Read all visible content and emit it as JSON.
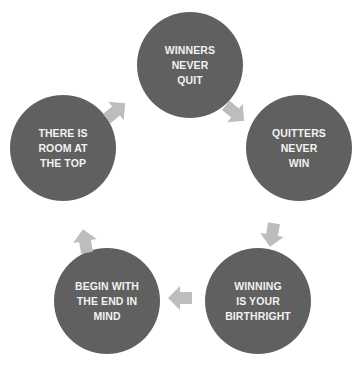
{
  "diagram": {
    "type": "cycle",
    "colors": {
      "node_fill": "#606060",
      "node_text": "#f2f2f2",
      "arrow_fill": "#bdbdbd",
      "background": "#ffffff"
    },
    "nodes": [
      {
        "id": "n1",
        "label": "WINNERS\nNEVER\nQUIT"
      },
      {
        "id": "n2",
        "label": "QUITTERS\nNEVER\nWIN"
      },
      {
        "id": "n3",
        "label": "WINNING\nIS YOUR\nBIRTHRIGHT"
      },
      {
        "id": "n4",
        "label": "BEGIN WITH\nTHE END IN\nMIND"
      },
      {
        "id": "n5",
        "label": "THERE IS\nROOM AT\nTHE TOP"
      }
    ],
    "edges": [
      {
        "from": "n1",
        "to": "n2",
        "icon": "arrow-down-right-icon"
      },
      {
        "from": "n2",
        "to": "n3",
        "icon": "arrow-down-icon"
      },
      {
        "from": "n3",
        "to": "n4",
        "icon": "arrow-left-icon"
      },
      {
        "from": "n4",
        "to": "n5",
        "icon": "arrow-up-icon"
      },
      {
        "from": "n5",
        "to": "n1",
        "icon": "arrow-up-right-icon"
      }
    ]
  }
}
